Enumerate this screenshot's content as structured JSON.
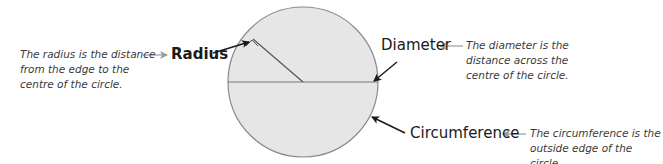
{
  "diagram": {
    "colors": {
      "circle_fill": "#e6e6e6",
      "circle_stroke": "#8a8a8a",
      "line": "#777777",
      "pointer_arrow": "#1a1a1a",
      "grey_arrow": "#9a9a9a",
      "text": "#1a1a1a",
      "desc_text": "#3a3a3a"
    },
    "parts": {
      "radius": {
        "label": "Radius",
        "description": "The radius is the distance\nfrom the edge to the\ncentre of the circle."
      },
      "diameter": {
        "label": "Diameter",
        "description": "The diameter is the\ndistance across the\ncentre of the circle."
      },
      "circumference": {
        "label": "Circumference",
        "description": "The circumference is the\noutside edge of the circle."
      }
    }
  }
}
